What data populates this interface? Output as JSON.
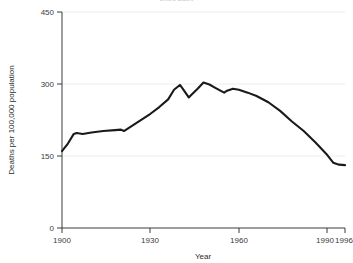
{
  "chart_data": {
    "type": "line",
    "title": "United States",
    "xlabel": "Year",
    "ylabel": "Deaths per 100,000 population",
    "xlim": [
      1900,
      1996
    ],
    "ylim": [
      0,
      450
    ],
    "xticks": [
      1900,
      1930,
      1960,
      1990,
      1996
    ],
    "xticklabels": [
      "1900",
      "1930",
      "1960",
      "1990",
      "1996"
    ],
    "yticks": [
      0,
      150,
      300,
      450
    ],
    "yticklabels": [
      "0",
      "150",
      "300",
      "450"
    ],
    "grid": "horizontal",
    "legend": "none",
    "line_color": "#1a1a1a",
    "grid_color": "#ededed",
    "series": [
      {
        "name": "Deaths per 100,000 population",
        "x": [
          1900,
          1902,
          1904,
          1905,
          1907,
          1910,
          1914,
          1918,
          1920,
          1921,
          1924,
          1927,
          1930,
          1933,
          1936,
          1938,
          1940,
          1941,
          1943,
          1944,
          1946,
          1948,
          1950,
          1952,
          1955,
          1956,
          1958,
          1960,
          1963,
          1966,
          1970,
          1974,
          1978,
          1982,
          1986,
          1990,
          1992,
          1994,
          1996
        ],
        "values": [
          160,
          176,
          196,
          198,
          196,
          199,
          202,
          204,
          205,
          202,
          214,
          226,
          238,
          252,
          268,
          288,
          298,
          290,
          272,
          278,
          290,
          303,
          299,
          292,
          282,
          286,
          290,
          288,
          282,
          275,
          262,
          244,
          222,
          202,
          178,
          152,
          136,
          132,
          131
        ]
      }
    ]
  },
  "axis_labels": {
    "x_title": "Year",
    "y_title": "Deaths per 100,000 population"
  }
}
